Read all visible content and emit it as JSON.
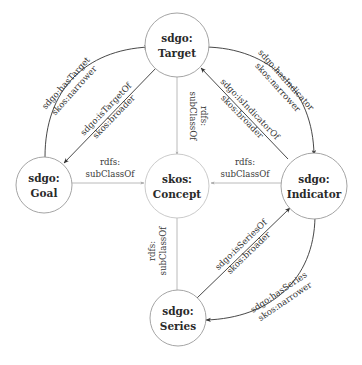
{
  "nodes": {
    "target": {
      "line1": "sdgo:",
      "line2": "Target"
    },
    "concept": {
      "line1": "skos:",
      "line2": "Concept"
    },
    "goal": {
      "line1": "sdgo:",
      "line2": "Goal"
    },
    "indicator": {
      "line1": "sdgo:",
      "line2": "Indicator"
    },
    "series": {
      "line1": "sdgo:",
      "line2": "Series"
    }
  },
  "edges": {
    "goal_has_target": {
      "line1": "sdgo:hasTarget",
      "line2": "skos:narrower"
    },
    "target_is_target_of": {
      "line1": "sdgo:isTargetOf",
      "line2": "skos:broader"
    },
    "target_has_indicator": {
      "line1": "sdgo:hasIndicator",
      "line2": "skos:narrower"
    },
    "indicator_is_indicator_of": {
      "line1": "sdgo:isIndicatorOf",
      "line2": "skos:broader"
    },
    "series_is_series_of": {
      "line1": "sdgo:isSeriesOf",
      "line2": "skos:broader"
    },
    "indicator_has_series": {
      "line1": "sdgo:hasSeries",
      "line2": "skos:narrower"
    },
    "target_subclass": {
      "line1": "rdfs:",
      "line2": "subClassOf"
    },
    "goal_subclass": {
      "line1": "rdfs:",
      "line2": "subClassOf"
    },
    "indicator_subclass": {
      "line1": "rdfs:",
      "line2": "subClassOf"
    },
    "series_subclass": {
      "line1": "rdfs:",
      "line2": "subClassOf"
    }
  },
  "colors": {
    "dark_edge": "#333333",
    "light_edge": "#a8a8a8",
    "node_stroke": "#9a9a9a"
  }
}
